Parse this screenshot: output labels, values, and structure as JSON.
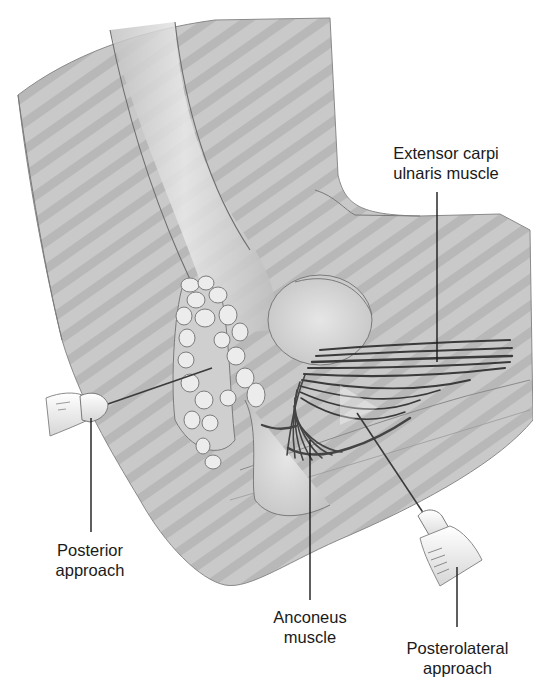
{
  "figure": {
    "colors": {
      "background": "#ffffff",
      "skin_fill": "#c9c9c9",
      "skin_stripe": "#b5b5b5",
      "bone_highlight": "#e4e4e4",
      "outline": "#6e6e6e",
      "muscle_dark": "#3a3a3a",
      "syringe_fill": "#f2f2f2",
      "label_text": "#1a1a1a",
      "leader_line": "#1a1a1a"
    }
  },
  "labels": {
    "extensor_carpi_ulnaris": {
      "line1": "Extensor carpi",
      "line2": "ulnaris muscle"
    },
    "posterior_approach": {
      "line1": "Posterior",
      "line2": "approach"
    },
    "anconeus_muscle": {
      "line1": "Anconeus",
      "line2": "muscle"
    },
    "posterolateral_approach": {
      "line1": "Posterolateral",
      "line2": "approach"
    }
  }
}
